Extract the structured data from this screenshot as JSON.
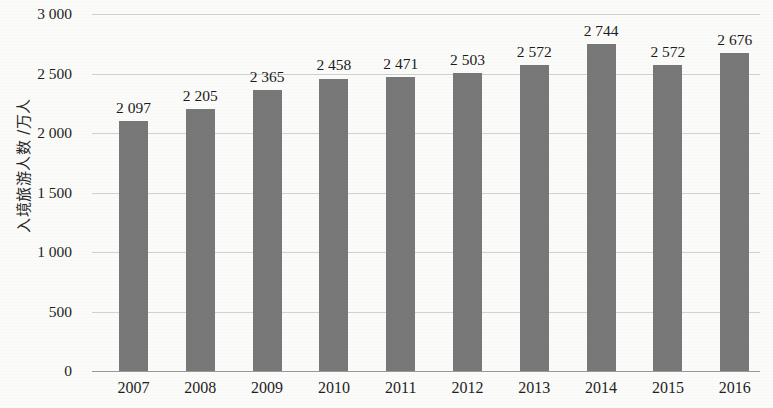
{
  "chart_data": {
    "type": "bar",
    "title": "",
    "subtitle": "",
    "xlabel": "",
    "ylabel": "入境旅游人数 /万人",
    "categories": [
      "2007",
      "2008",
      "2009",
      "2010",
      "2011",
      "2012",
      "2013",
      "2014",
      "2015",
      "2016"
    ],
    "values": [
      2097,
      2205,
      2365,
      2458,
      2471,
      2503,
      2572,
      2744,
      2572,
      2676
    ],
    "value_labels": [
      "2 097",
      "2 205",
      "2 365",
      "2 458",
      "2 471",
      "2 503",
      "2 572",
      "2 744",
      "2 572",
      "2 676"
    ],
    "ylim": [
      0,
      3000
    ],
    "ytick_values": [
      3000,
      2500,
      2000,
      1500,
      1000,
      500,
      0
    ],
    "ytick_labels": [
      "3 000",
      "2 500",
      "2 000",
      "1 500",
      "1 000",
      "500",
      "0"
    ],
    "grid": true,
    "legend": "none",
    "series": [
      {
        "name": "入境旅游人数",
        "values": [
          2097,
          2205,
          2365,
          2458,
          2471,
          2503,
          2572,
          2744,
          2572,
          2676
        ]
      }
    ],
    "colors": {
      "bar": "#787878",
      "gridline": "#c9c9c9",
      "axis": "#9a9a9a",
      "text": "#1f1f1f",
      "background": "#fbfbfa"
    }
  }
}
